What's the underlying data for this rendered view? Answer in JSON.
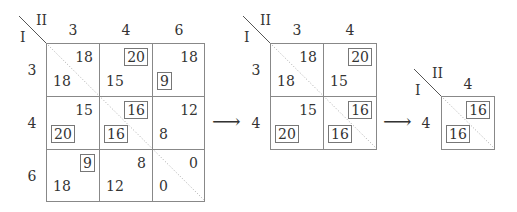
{
  "diagram": {
    "player_row_label": "I",
    "player_col_label": "II",
    "arrow_glyph": "⟶",
    "matrices": [
      {
        "name": "full-3x3",
        "col_headers": [
          "3",
          "4",
          "6"
        ],
        "row_headers": [
          "3",
          "4",
          "6"
        ],
        "cells": [
          [
            {
              "top_right": "18",
              "tr_boxed": false,
              "bottom_left": "18",
              "bl_boxed": false
            },
            {
              "top_right": "20",
              "tr_boxed": true,
              "bottom_left": "15",
              "bl_boxed": false
            },
            {
              "top_right": "18",
              "tr_boxed": false,
              "bottom_left": "9",
              "bl_boxed": true
            }
          ],
          [
            {
              "top_right": "15",
              "tr_boxed": false,
              "bottom_left": "20",
              "bl_boxed": true
            },
            {
              "top_right": "16",
              "tr_boxed": true,
              "bottom_left": "16",
              "bl_boxed": true
            },
            {
              "top_right": "12",
              "tr_boxed": false,
              "bottom_left": "8",
              "bl_boxed": false
            }
          ],
          [
            {
              "top_right": "9",
              "tr_boxed": true,
              "bottom_left": "18",
              "bl_boxed": false
            },
            {
              "top_right": "8",
              "tr_boxed": false,
              "bottom_left": "12",
              "bl_boxed": false
            },
            {
              "top_right": "0",
              "tr_boxed": false,
              "bottom_left": "0",
              "bl_boxed": false
            }
          ]
        ]
      },
      {
        "name": "reduced-2x2",
        "col_headers": [
          "3",
          "4"
        ],
        "row_headers": [
          "3",
          "4"
        ],
        "cells": [
          [
            {
              "top_right": "18",
              "tr_boxed": false,
              "bottom_left": "18",
              "bl_boxed": false
            },
            {
              "top_right": "20",
              "tr_boxed": true,
              "bottom_left": "15",
              "bl_boxed": false
            }
          ],
          [
            {
              "top_right": "15",
              "tr_boxed": false,
              "bottom_left": "20",
              "bl_boxed": true
            },
            {
              "top_right": "16",
              "tr_boxed": true,
              "bottom_left": "16",
              "bl_boxed": true
            }
          ]
        ]
      },
      {
        "name": "reduced-1x1",
        "col_headers": [
          "4"
        ],
        "row_headers": [
          "4"
        ],
        "cells": [
          [
            {
              "top_right": "16",
              "tr_boxed": true,
              "bottom_left": "16",
              "bl_boxed": true
            }
          ]
        ]
      }
    ]
  }
}
